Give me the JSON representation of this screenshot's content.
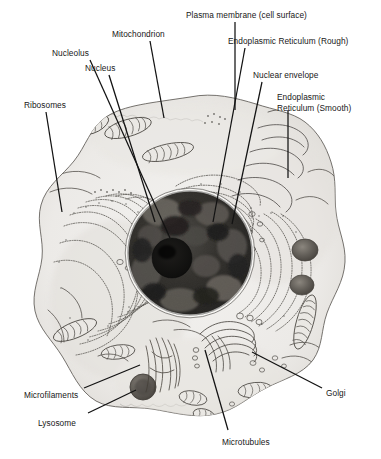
{
  "figure": {
    "type": "labeled-biological-diagram",
    "background_color": "#ffffff",
    "ink_color": "#171717",
    "cytoplasm_color": "#efeeec",
    "nucleus_color": "#2b2a28",
    "nucleolus_color": "#141312"
  },
  "labels": [
    {
      "id": "plasma-membrane",
      "text": "Plasma membrane (cell surface)",
      "x": 186,
      "y": 10,
      "anchor": "start",
      "leader": [
        [
          235,
          22
        ],
        [
          235,
          110
        ]
      ]
    },
    {
      "id": "mitochondrion",
      "text": "Mitochondrion",
      "x": 112,
      "y": 29,
      "anchor": "start",
      "leader": [
        [
          150,
          41
        ],
        [
          164,
          118
        ]
      ]
    },
    {
      "id": "er-rough",
      "text": "Endoplasmic Reticulum (Rough)",
      "x": 228,
      "y": 36,
      "anchor": "start",
      "leader": [
        [
          245,
          48
        ],
        [
          213,
          222
        ]
      ]
    },
    {
      "id": "nucleolus",
      "text": "Nucleolus",
      "x": 52,
      "y": 48,
      "anchor": "start",
      "leader": [
        [
          90,
          60
        ],
        [
          170,
          238
        ]
      ]
    },
    {
      "id": "nucleus",
      "text": "Nucleus",
      "x": 85,
      "y": 63,
      "anchor": "start",
      "leader": [
        [
          109,
          75
        ],
        [
          155,
          222
        ]
      ]
    },
    {
      "id": "nuclear-envelope",
      "text": "Nuclear envelope",
      "x": 253,
      "y": 70,
      "anchor": "start",
      "leader": [
        [
          262,
          82
        ],
        [
          232,
          224
        ]
      ]
    },
    {
      "id": "er-smooth",
      "text": "Endoplasmic\nReticulum (Smooth)",
      "x": 277,
      "y": 92,
      "anchor": "start",
      "leader": [
        [
          288,
          110
        ],
        [
          288,
          178
        ]
      ]
    },
    {
      "id": "ribosomes",
      "text": "Ribosomes",
      "x": 24,
      "y": 100,
      "anchor": "start",
      "leader": [
        [
          46,
          112
        ],
        [
          62,
          212
        ]
      ]
    },
    {
      "id": "microfilaments",
      "text": "Microfilaments",
      "x": 24,
      "y": 390,
      "anchor": "start",
      "leader": [
        [
          84,
          388
        ],
        [
          140,
          365
        ]
      ]
    },
    {
      "id": "lysosome",
      "text": "Lysosome",
      "x": 38,
      "y": 418,
      "anchor": "start",
      "leader": [
        [
          88,
          413
        ],
        [
          136,
          390
        ]
      ]
    },
    {
      "id": "microtubules",
      "text": "Microtubules",
      "x": 222,
      "y": 437,
      "anchor": "start",
      "leader": [
        [
          228,
          430
        ],
        [
          205,
          350
        ]
      ]
    },
    {
      "id": "golgi",
      "text": "Golgi",
      "x": 326,
      "y": 388,
      "anchor": "start",
      "leader": [
        [
          322,
          388
        ],
        [
          252,
          352
        ]
      ]
    }
  ],
  "structures": {
    "cell_outline": "irregular rounded amoeboid cell occupying most of frame",
    "nucleus": {
      "cx": 190,
      "cy": 253,
      "r": 62,
      "description": "large dark mottled sphere, chromatin texture"
    },
    "nucleolus": {
      "cx": 172,
      "cy": 258,
      "r": 20,
      "description": "very dark dense round body inside nucleus"
    },
    "mitochondria_count": 9,
    "lysosome_granules": 3,
    "golgi_stack": "curved stack of flattened cisternae with vesicles, lower centre-right",
    "microfilament_bundle": "fibrous strands, lower centre",
    "rough_er": "concentric wavy stippled cisternae surrounding nucleus, left and right",
    "smooth_er": "smooth tubular profiles, upper right"
  }
}
